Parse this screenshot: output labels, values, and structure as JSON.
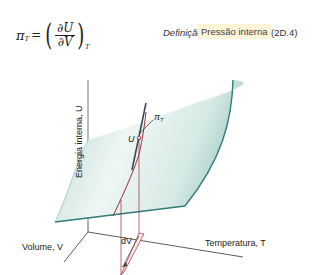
{
  "equation": {
    "lhs_symbol": "π",
    "lhs_subscript": "T",
    "equals": "=",
    "numerator": "∂U",
    "denominator": "∂V",
    "constant_subscript": "T",
    "tag_type": "Definição",
    "tag_name": "Pressão interna",
    "tag_number": "(2D.4)"
  },
  "diagram": {
    "y_axis_label": "Energia interna, U",
    "x_axis_label": "Temperatura, T",
    "z_axis_label": "Volume, V",
    "point_label": "U",
    "slope_label": "πT",
    "slope_symbol": "π",
    "slope_subscript": "T",
    "increment_label": "dV",
    "colors": {
      "surface": "#cfe5e1",
      "surface_edge": "#2f7c7a",
      "axis": "#333333",
      "curve": "#9b2c3a"
    }
  }
}
